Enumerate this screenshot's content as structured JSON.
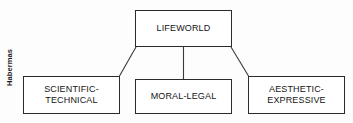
{
  "figure": {
    "margin_label": "Habermas",
    "root": {
      "label": "LIFEWORLD"
    },
    "branches": [
      {
        "label": "SCIENTIFIC-\nTECHNICAL"
      },
      {
        "label": "MORAL-LEGAL"
      },
      {
        "label": "AESTHETIC-\nEXPRESSIVE"
      }
    ],
    "colors": {
      "background": "#fdfdfd",
      "box_fill": "#ffffff",
      "box_stroke": "#2b2b2b",
      "text": "#141414",
      "connector": "#3a3a3a"
    }
  }
}
